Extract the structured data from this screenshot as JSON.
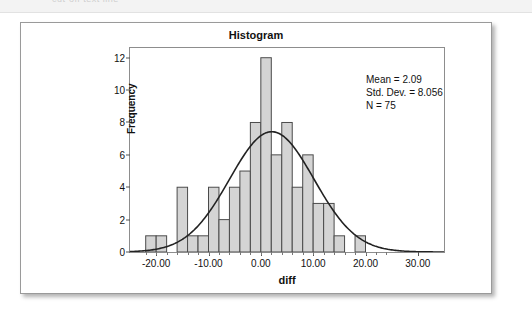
{
  "top_strip": {
    "ghost_text": "cut-off text line"
  },
  "figure": {
    "title": "Histogram",
    "x_axis": {
      "label": "diff",
      "ticks": [
        "-20.00",
        "-10.00",
        "0.00",
        "10.00",
        "20.00",
        "30.00"
      ],
      "tick_values": [
        -20,
        -10,
        0,
        10,
        20,
        30
      ],
      "min": -25,
      "max": 35
    },
    "y_axis": {
      "label": "Frequency",
      "ticks": [
        "0",
        "2",
        "4",
        "6",
        "8",
        "10",
        "12"
      ],
      "tick_values": [
        0,
        2,
        4,
        6,
        8,
        10,
        12
      ],
      "min": 0,
      "max": 12.6
    },
    "stats": {
      "mean": "Mean = 2.09",
      "std_dev": "Std. Dev. = 8.056",
      "n": "N = 75"
    }
  },
  "chart_data": {
    "type": "bar",
    "title": "Histogram",
    "xlabel": "diff",
    "ylabel": "Frequency",
    "xlim": [
      -25,
      35
    ],
    "ylim": [
      0,
      12.6
    ],
    "grid": false,
    "bin_width": 2,
    "bin_starts": [
      -22,
      -20,
      -18,
      -16,
      -14,
      -12,
      -10,
      -8,
      -6,
      -4,
      -2,
      0,
      2,
      4,
      6,
      8,
      10,
      12,
      14,
      16,
      18,
      20,
      22
    ],
    "categories": [
      "-22",
      "-20",
      "-18",
      "-16",
      "-14",
      "-12",
      "-10",
      "-8",
      "-6",
      "-4",
      "-2",
      "0",
      "2",
      "4",
      "6",
      "8",
      "10",
      "12",
      "14",
      "16",
      "18",
      "20",
      "22"
    ],
    "values": [
      1,
      1,
      0,
      4,
      1,
      1,
      4,
      2,
      4,
      5,
      8,
      12,
      6,
      8,
      4,
      6,
      3,
      3,
      1,
      0,
      1,
      0,
      0
    ],
    "bar_fill": "#d4d4d4",
    "bar_stroke": "#4a4a4a",
    "overlay": {
      "type": "line",
      "name": "normal curve",
      "mean": 2.09,
      "std_dev": 8.056,
      "n": 75,
      "peak_value": 7.43,
      "color": "#222222"
    },
    "annotations": [
      "Mean = 2.09",
      "Std. Dev. = 8.056",
      "N = 75"
    ]
  }
}
